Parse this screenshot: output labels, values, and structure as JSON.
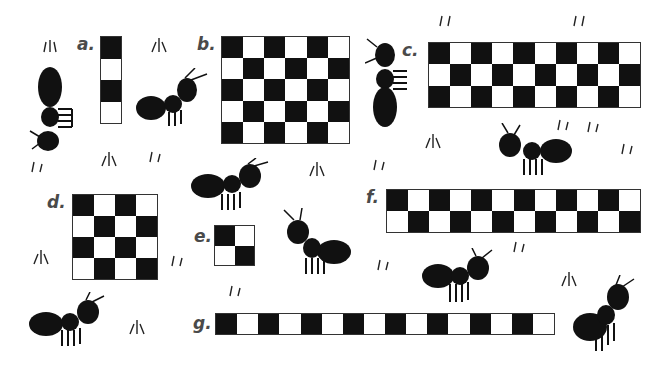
{
  "grids": [
    {
      "label": "a.",
      "cols": 1,
      "rows": 4,
      "first": "black",
      "x": 100,
      "y": 36,
      "w": 22,
      "h": 88,
      "lx": 77,
      "ly": 34
    },
    {
      "label": "b.",
      "cols": 6,
      "rows": 5,
      "first": "black",
      "x": 221,
      "y": 36,
      "w": 129,
      "h": 108,
      "lx": 197,
      "ly": 34
    },
    {
      "label": "c.",
      "cols": 10,
      "rows": 3,
      "first": "black",
      "x": 428,
      "y": 42,
      "w": 213,
      "h": 66,
      "lx": 402,
      "ly": 40
    },
    {
      "label": "d.",
      "cols": 4,
      "rows": 4,
      "first": "black",
      "x": 72,
      "y": 194,
      "w": 86,
      "h": 86,
      "lx": 47,
      "ly": 192
    },
    {
      "label": "e.",
      "cols": 2,
      "rows": 2,
      "first": "black",
      "x": 214,
      "y": 225,
      "w": 41,
      "h": 41,
      "lx": 194,
      "ly": 226
    },
    {
      "label": "f.",
      "cols": 12,
      "rows": 2,
      "first": "black",
      "x": 386,
      "y": 189,
      "w": 255,
      "h": 44,
      "lx": 366,
      "ly": 187
    },
    {
      "label": "g.",
      "cols": 16,
      "rows": 1,
      "first": "black",
      "x": 215,
      "y": 313,
      "w": 340,
      "h": 22,
      "lx": 193,
      "ly": 313
    }
  ],
  "colors": {
    "black_square": "#111111",
    "white_square": "#ffffff",
    "label": "#4a4a4a"
  }
}
